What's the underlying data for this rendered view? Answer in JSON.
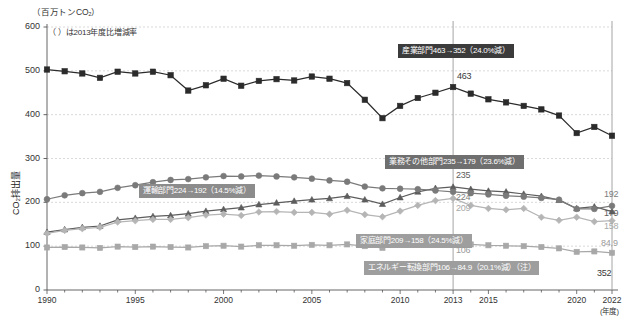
{
  "meta": {
    "unit_label": "（百万トンCO₂）",
    "note": "（  ）は2013年度比増減率",
    "y_axis_title": "CO₂排出量",
    "x_axis_unit": "(年度)"
  },
  "callouts": [
    {
      "id": "industry",
      "text": "産業部門463→352（24.0%減）",
      "style": "dark",
      "x": 398,
      "y": 44
    },
    {
      "id": "commercial",
      "text": "業務その他部門235→179（23.6%減）",
      "style": "mid",
      "x": 385,
      "y": 155
    },
    {
      "id": "transport",
      "text": "運輸部門224→192（14.5%減）",
      "style": "midlight",
      "x": 139,
      "y": 184
    },
    {
      "id": "household",
      "text": "家庭部門209→158（24.5%減）",
      "style": "light",
      "x": 356,
      "y": 234
    },
    {
      "id": "energy",
      "text": "エネルギー転換部門106→84.9（20.1%減）（注）",
      "style": "light",
      "x": 364,
      "y": 261
    }
  ],
  "point_labels": [
    {
      "id": "industry-2013",
      "text": "463",
      "cls": "v-dark",
      "x": 457,
      "y": 71
    },
    {
      "id": "industry-2022",
      "text": "352",
      "cls": "v-dark",
      "x": 597,
      "y": 268
    },
    {
      "id": "commercial-2013",
      "text": "235",
      "cls": "v-mid",
      "x": 456,
      "y": 170
    },
    {
      "id": "transport-2013",
      "text": "224",
      "cls": "v-midlight",
      "x": 456,
      "y": 192
    },
    {
      "id": "household-2013",
      "text": "209",
      "cls": "v-light",
      "x": 456,
      "y": 203
    },
    {
      "id": "energy-2013",
      "text": "106",
      "cls": "v-sq",
      "x": 456,
      "y": 245
    },
    {
      "id": "transport-2022",
      "text": "192",
      "cls": "v-midlight",
      "x": 604,
      "y": 189
    },
    {
      "id": "commercial-2022",
      "text": "179",
      "cls": "v-mid",
      "x": 604,
      "y": 208
    },
    {
      "id": "household-2022",
      "text": "158",
      "cls": "v-light",
      "x": 604,
      "y": 221
    },
    {
      "id": "energy-2022",
      "text": "84.9",
      "cls": "v-sq",
      "x": 601,
      "y": 238
    }
  ],
  "chart_data": {
    "type": "line",
    "title": "",
    "xlabel": "(年度)",
    "ylabel": "CO₂排出量",
    "unit": "百万トンCO₂",
    "note": "（  ）は2013年度比増減率",
    "grid": true,
    "legend": "inline-callouts",
    "xlim": [
      1990,
      2022
    ],
    "ylim": [
      0,
      600
    ],
    "y_ticks": [
      0,
      100,
      200,
      300,
      400,
      500,
      600
    ],
    "x_ticks": [
      1990,
      1995,
      2000,
      2005,
      2010,
      2013,
      2015,
      2020,
      2022
    ],
    "reference_line_x": 2013,
    "x": [
      1990,
      1991,
      1992,
      1993,
      1994,
      1995,
      1996,
      1997,
      1998,
      1999,
      2000,
      2001,
      2002,
      2003,
      2004,
      2005,
      2006,
      2007,
      2008,
      2009,
      2010,
      2011,
      2012,
      2013,
      2014,
      2015,
      2016,
      2017,
      2018,
      2019,
      2020,
      2021,
      2022
    ],
    "series": [
      {
        "name": "産業部門",
        "key": "industry",
        "marker": "square",
        "color": "#2b2b2b",
        "start_value": 503,
        "v2013": 463,
        "v2022": 352,
        "change_pct": "24.0%減",
        "values": [
          503,
          499,
          494,
          484,
          498,
          494,
          498,
          490,
          455,
          467,
          482,
          466,
          477,
          481,
          478,
          487,
          482,
          472,
          434,
          392,
          420,
          438,
          450,
          463,
          448,
          435,
          428,
          420,
          412,
          398,
          358,
          372,
          352
        ]
      },
      {
        "name": "業務その他部門",
        "key": "commercial",
        "marker": "triangle",
        "color": "#5d5d5d",
        "start_value": 132,
        "v2013": 235,
        "v2022": 179,
        "change_pct": "23.6%減",
        "values": [
          132,
          138,
          143,
          146,
          160,
          164,
          168,
          170,
          174,
          180,
          184,
          188,
          195,
          199,
          203,
          206,
          209,
          214,
          206,
          196,
          211,
          224,
          232,
          235,
          230,
          226,
          224,
          219,
          214,
          205,
          186,
          190,
          179
        ]
      },
      {
        "name": "運輸部門",
        "key": "transport",
        "marker": "circle",
        "color": "#7a7a7a",
        "start_value": 207,
        "v2013": 224,
        "v2022": 192,
        "change_pct": "14.5%減",
        "values": [
          207,
          216,
          221,
          224,
          233,
          239,
          246,
          251,
          253,
          257,
          260,
          259,
          261,
          259,
          257,
          254,
          250,
          247,
          236,
          232,
          231,
          230,
          227,
          224,
          221,
          218,
          215,
          213,
          210,
          206,
          185,
          185,
          192
        ]
      },
      {
        "name": "家庭部門",
        "key": "household",
        "marker": "diamond",
        "color": "#b5b5b5",
        "start_value": 129,
        "v2013": 209,
        "v2022": 158,
        "change_pct": "24.5%減",
        "values": [
          129,
          136,
          140,
          143,
          155,
          158,
          161,
          161,
          165,
          171,
          173,
          170,
          178,
          179,
          177,
          177,
          173,
          182,
          172,
          167,
          180,
          193,
          204,
          209,
          193,
          186,
          183,
          186,
          166,
          159,
          166,
          156,
          158
        ]
      },
      {
        "name": "エネルギー転換部門",
        "key": "energy",
        "marker": "square-open",
        "color": "#a8a8a8",
        "start_value": 97,
        "v2013": 106,
        "v2022": 84.9,
        "change_pct": "20.1%減",
        "note_marker": "（注）",
        "values": [
          97,
          98,
          97,
          96,
          99,
          98,
          99,
          98,
          97,
          100,
          101,
          99,
          102,
          102,
          101,
          103,
          102,
          104,
          100,
          96,
          103,
          107,
          111,
          106,
          104,
          102,
          101,
          100,
          98,
          95,
          87,
          88,
          84.9
        ]
      }
    ]
  }
}
